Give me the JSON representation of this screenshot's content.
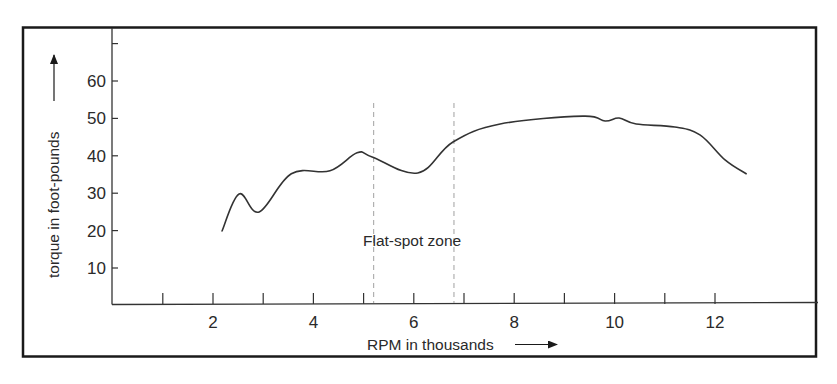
{
  "chart_data": {
    "type": "line",
    "title": "",
    "xlabel": "RPM in thousands",
    "ylabel": "torque in foot-pounds",
    "xlim": [
      0,
      14
    ],
    "ylim": [
      0,
      70
    ],
    "x_ticks": [
      1,
      2,
      3,
      4,
      5,
      6,
      7,
      8,
      9,
      10,
      11,
      12
    ],
    "x_tick_labels": [
      "",
      "2",
      "",
      "4",
      "",
      "6",
      "",
      "8",
      "",
      "10",
      "",
      "12"
    ],
    "y_ticks": [
      10,
      20,
      30,
      40,
      50,
      60,
      70
    ],
    "y_tick_labels": [
      "10",
      "20",
      "30",
      "40",
      "50",
      "60",
      ""
    ],
    "grid": false,
    "legend": null,
    "series": [
      {
        "name": "torque",
        "color": "#333333",
        "x": [
          2.18,
          2.52,
          2.92,
          3.56,
          4.33,
          4.87,
          5.17,
          6.08,
          6.78,
          7.72,
          9.37,
          9.81,
          10.09,
          10.43,
          11.2,
          11.7,
          12.2,
          12.62
        ],
        "y": [
          19.9,
          29.8,
          25.0,
          35.2,
          36.0,
          40.8,
          39.7,
          35.4,
          43.7,
          48.5,
          50.6,
          49.3,
          50.1,
          48.5,
          47.7,
          45.6,
          38.9,
          35.2
        ]
      }
    ],
    "annotations": [
      {
        "text": "Flat-spot zone",
        "type": "region",
        "x_start": 5.2,
        "x_end": 6.8,
        "style": "dashed-vertical-lines"
      }
    ]
  },
  "labels": {
    "x_axis_title": "RPM in thousands",
    "y_axis_title": "torque in foot-pounds",
    "zone_label": "Flat-spot zone"
  }
}
